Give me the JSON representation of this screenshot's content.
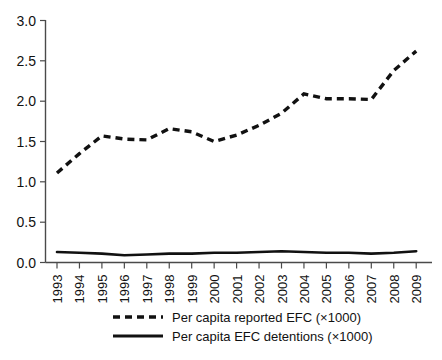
{
  "chart_data": {
    "type": "line",
    "title": "",
    "subtitle": "",
    "xlabel": "",
    "ylabel": "",
    "x": [
      1993,
      1994,
      1995,
      1996,
      1997,
      1998,
      1999,
      2000,
      2001,
      2002,
      2003,
      2004,
      2005,
      2006,
      2007,
      2008,
      2009
    ],
    "categories": [
      "1993",
      "1994",
      "1995",
      "1996",
      "1997",
      "1998",
      "1999",
      "2000",
      "2001",
      "2002",
      "2003",
      "2004",
      "2005",
      "2006",
      "2007",
      "2008",
      "2009"
    ],
    "series": [
      {
        "name": "Per capita reported EFC (×1000)",
        "style": "dashed",
        "color": "#111111",
        "values": [
          1.11,
          1.35,
          1.57,
          1.53,
          1.52,
          1.66,
          1.62,
          1.5,
          1.58,
          1.7,
          1.85,
          2.09,
          2.03,
          2.03,
          2.02,
          2.38,
          2.62
        ]
      },
      {
        "name": "Per capita EFC detentions (×1000)",
        "style": "solid",
        "color": "#111111",
        "values": [
          0.13,
          0.12,
          0.11,
          0.09,
          0.1,
          0.11,
          0.11,
          0.12,
          0.12,
          0.13,
          0.14,
          0.13,
          0.12,
          0.12,
          0.11,
          0.12,
          0.14
        ]
      }
    ],
    "ylim": [
      0.0,
      3.0
    ],
    "yticks": [
      0.0,
      0.5,
      1.0,
      1.5,
      2.0,
      2.5,
      3.0
    ],
    "ytick_labels": [
      "0.0",
      "0.5",
      "1.0",
      "1.5",
      "2.0",
      "2.5",
      "3.0"
    ],
    "grid": false,
    "legend_position": "bottom",
    "legend": [
      "Per capita reported EFC (×1000)",
      "Per capita EFC detentions (×1000)"
    ]
  },
  "axes": {
    "y_tick_labels": [
      "3.0",
      "2.5",
      "2.0",
      "1.5",
      "1.0",
      "0.5",
      "0.0"
    ],
    "x_tick_labels": [
      "1993",
      "1994",
      "1995",
      "1996",
      "1997",
      "1998",
      "1999",
      "2000",
      "2001",
      "2002",
      "2003",
      "2004",
      "2005",
      "2006",
      "2007",
      "2008",
      "2009"
    ]
  },
  "legend": {
    "items": [
      {
        "label": "Per capita reported EFC (×1000)",
        "style": "dashed"
      },
      {
        "label": "Per capita EFC detentions (×1000)",
        "style": "solid"
      }
    ]
  },
  "colors": {
    "series": "#111111",
    "axis": "#4a4a4a",
    "background": "#ffffff"
  }
}
